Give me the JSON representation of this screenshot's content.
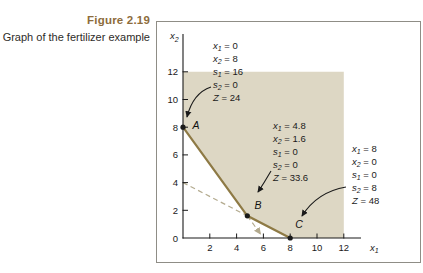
{
  "figure": {
    "label": "Figure 2.19",
    "caption": "Graph of the fertilizer example"
  },
  "colors": {
    "figure_label": "#8d6c3b",
    "caption_text": "#2e2c29",
    "box_border": "#8f8d86",
    "axis": "#1a1a1a",
    "region_fill": "#ddd7c4",
    "boundary_line": "#8e7a45",
    "dashed_line": "#b3aa8e"
  },
  "chart_data": {
    "type": "line",
    "title": "Graph of the fertilizer example",
    "xlabel": {
      "base": "x",
      "sub": "1"
    },
    "ylabel": {
      "base": "x",
      "sub": "2"
    },
    "xlim": [
      0,
      13.5
    ],
    "ylim": [
      0,
      13.5
    ],
    "x_ticks": [
      2,
      4,
      6,
      8,
      10,
      12
    ],
    "y_ticks": [
      0,
      2,
      4,
      6,
      8,
      10,
      12
    ],
    "grid": false,
    "legend": false,
    "feasible_region": {
      "vertices": [
        [
          0,
          8
        ],
        [
          4.8,
          1.6
        ],
        [
          8,
          0
        ],
        [
          12,
          0
        ],
        [
          12,
          12
        ],
        [
          0,
          12
        ]
      ]
    },
    "boundary_line": {
      "points": [
        [
          0,
          8
        ],
        [
          4.8,
          1.6
        ],
        [
          8,
          0
        ]
      ]
    },
    "dashed_lines": [
      {
        "name": "constraint-extension-dashed-1",
        "from": [
          0,
          4
        ],
        "to": [
          4.8,
          1.6
        ],
        "arrow": false
      },
      {
        "name": "constraint-extension-dashed-2",
        "from": [
          4.8,
          1.6
        ],
        "to": [
          6,
          0
        ],
        "arrow": true
      }
    ],
    "corner_points": [
      {
        "label": "A",
        "x": 0,
        "y": 8,
        "solution": [
          [
            "x",
            "1",
            "0"
          ],
          [
            "x",
            "2",
            "8"
          ],
          [
            "s",
            "1",
            "16"
          ],
          [
            "s",
            "2",
            "0"
          ],
          [
            "Z",
            "",
            "24"
          ]
        ]
      },
      {
        "label": "B",
        "x": 4.8,
        "y": 1.6,
        "solution": [
          [
            "x",
            "1",
            "4.8"
          ],
          [
            "x",
            "2",
            "1.6"
          ],
          [
            "s",
            "1",
            "0"
          ],
          [
            "s",
            "2",
            "0"
          ],
          [
            "Z",
            "",
            "33.6"
          ]
        ]
      },
      {
        "label": "C",
        "x": 8,
        "y": 0,
        "solution": [
          [
            "x",
            "1",
            "8"
          ],
          [
            "x",
            "2",
            "0"
          ],
          [
            "s",
            "1",
            "0"
          ],
          [
            "s",
            "2",
            "8"
          ],
          [
            "Z",
            "",
            "48"
          ]
        ]
      }
    ]
  }
}
